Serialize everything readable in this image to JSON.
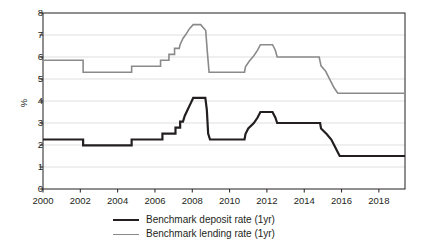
{
  "chart_data": {
    "type": "line",
    "title": "",
    "subtitle": "",
    "xlabel": "",
    "ylabel": "%",
    "ylim": [
      0,
      8
    ],
    "xlim": [
      2000,
      2019.4
    ],
    "yticks": [
      0,
      1,
      2,
      3,
      4,
      5,
      6,
      7,
      8
    ],
    "ytick_labels": [
      "0",
      "1",
      "2",
      "3",
      "4",
      "5",
      "6",
      "7",
      "8"
    ],
    "xticks": [
      2000,
      2002,
      2004,
      2006,
      2008,
      2010,
      2012,
      2014,
      2016,
      2018
    ],
    "xtick_labels": [
      "2000",
      "2002",
      "2004",
      "2006",
      "2008",
      "2010",
      "2012",
      "2014",
      "2016",
      "2018"
    ],
    "grid": "horizontal",
    "legend_position": "bottom-center",
    "step_style": "post",
    "series": [
      {
        "name": "Benchmark deposit rate (1yr)",
        "color": "#231f20",
        "line_width": 2.2,
        "points": [
          [
            2000.0,
            2.25
          ],
          [
            2002.15,
            2.25
          ],
          [
            2002.15,
            1.98
          ],
          [
            2004.75,
            1.98
          ],
          [
            2004.75,
            2.25
          ],
          [
            2006.4,
            2.25
          ],
          [
            2006.4,
            2.52
          ],
          [
            2007.1,
            2.52
          ],
          [
            2007.1,
            2.79
          ],
          [
            2007.35,
            2.79
          ],
          [
            2007.35,
            3.06
          ],
          [
            2007.5,
            3.06
          ],
          [
            2007.6,
            3.33
          ],
          [
            2007.75,
            3.6
          ],
          [
            2007.9,
            3.87
          ],
          [
            2008.05,
            4.14
          ],
          [
            2008.7,
            4.14
          ],
          [
            2008.78,
            3.6
          ],
          [
            2008.85,
            2.52
          ],
          [
            2008.95,
            2.25
          ],
          [
            2010.8,
            2.25
          ],
          [
            2010.85,
            2.5
          ],
          [
            2011.0,
            2.75
          ],
          [
            2011.3,
            3.0
          ],
          [
            2011.5,
            3.25
          ],
          [
            2011.65,
            3.5
          ],
          [
            2012.3,
            3.5
          ],
          [
            2012.45,
            3.25
          ],
          [
            2012.55,
            3.0
          ],
          [
            2014.85,
            3.0
          ],
          [
            2014.9,
            2.75
          ],
          [
            2015.2,
            2.5
          ],
          [
            2015.45,
            2.25
          ],
          [
            2015.6,
            2.0
          ],
          [
            2015.75,
            1.75
          ],
          [
            2015.9,
            1.5
          ],
          [
            2019.4,
            1.5
          ]
        ]
      },
      {
        "name": "Benchmark lending rate (1yr)",
        "color": "#8a8a8a",
        "line_width": 1.6,
        "points": [
          [
            2000.0,
            5.85
          ],
          [
            2002.15,
            5.85
          ],
          [
            2002.15,
            5.31
          ],
          [
            2004.75,
            5.31
          ],
          [
            2004.75,
            5.58
          ],
          [
            2006.3,
            5.58
          ],
          [
            2006.3,
            5.85
          ],
          [
            2006.75,
            5.85
          ],
          [
            2006.75,
            6.12
          ],
          [
            2007.05,
            6.12
          ],
          [
            2007.05,
            6.39
          ],
          [
            2007.3,
            6.39
          ],
          [
            2007.35,
            6.57
          ],
          [
            2007.5,
            6.84
          ],
          [
            2007.65,
            7.02
          ],
          [
            2007.85,
            7.29
          ],
          [
            2008.05,
            7.47
          ],
          [
            2008.45,
            7.47
          ],
          [
            2008.72,
            7.2
          ],
          [
            2008.8,
            6.3
          ],
          [
            2008.9,
            5.31
          ],
          [
            2010.8,
            5.31
          ],
          [
            2010.85,
            5.56
          ],
          [
            2011.05,
            5.81
          ],
          [
            2011.3,
            6.06
          ],
          [
            2011.5,
            6.31
          ],
          [
            2011.65,
            6.56
          ],
          [
            2012.3,
            6.56
          ],
          [
            2012.45,
            6.31
          ],
          [
            2012.55,
            6.0
          ],
          [
            2014.8,
            6.0
          ],
          [
            2014.9,
            5.6
          ],
          [
            2015.15,
            5.35
          ],
          [
            2015.3,
            5.1
          ],
          [
            2015.45,
            4.85
          ],
          [
            2015.6,
            4.6
          ],
          [
            2015.8,
            4.35
          ],
          [
            2019.4,
            4.35
          ]
        ]
      }
    ]
  },
  "legend": {
    "items": [
      {
        "label": "Benchmark deposit rate (1yr)",
        "swatch": "deposit"
      },
      {
        "label": "Benchmark lending rate (1yr)",
        "swatch": "lending"
      }
    ]
  },
  "colors": {
    "deposit": "#231f20",
    "lending": "#8a8a8a",
    "grid": "#d7d7d7",
    "axis": "#231f20",
    "text": "#231f20",
    "background": "#ffffff"
  }
}
